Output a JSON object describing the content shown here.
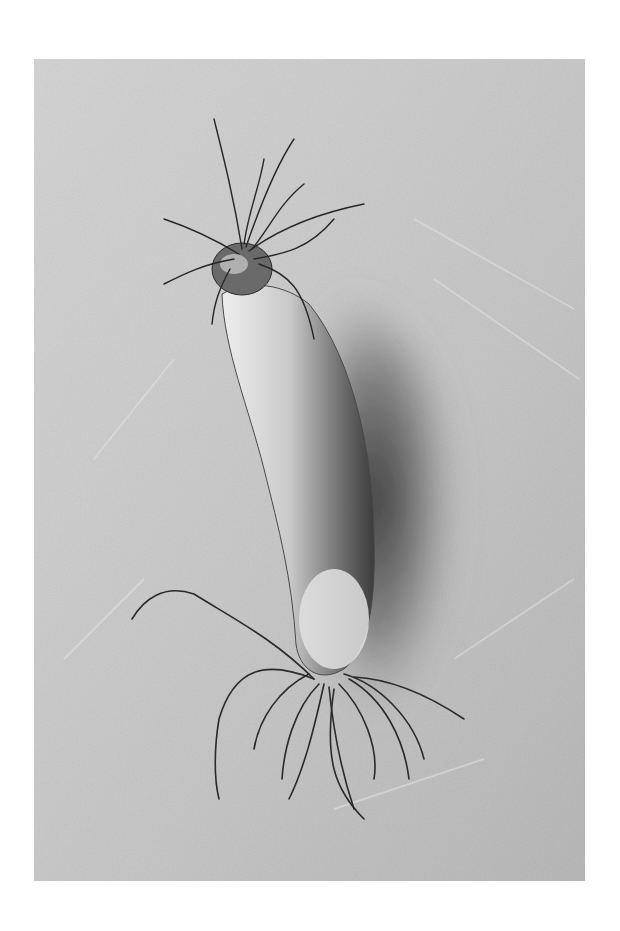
{
  "image": {
    "alt": "Black and white photograph of a single radish root with hairy rootlets at both ends lying on a textured plaster surface, casting a shadow to the right",
    "subject": "radish",
    "style": "monochrome",
    "background": "textured plaster",
    "border_color": "#ffffff",
    "colors": {
      "surface_light": "#d4d4d4",
      "surface_mid": "#bdbdbd",
      "shadow": "#3a3a3a",
      "radish_light": "#e6e6e6",
      "radish_dark": "#5a5a5a",
      "roots": "#2a2a2a"
    }
  }
}
